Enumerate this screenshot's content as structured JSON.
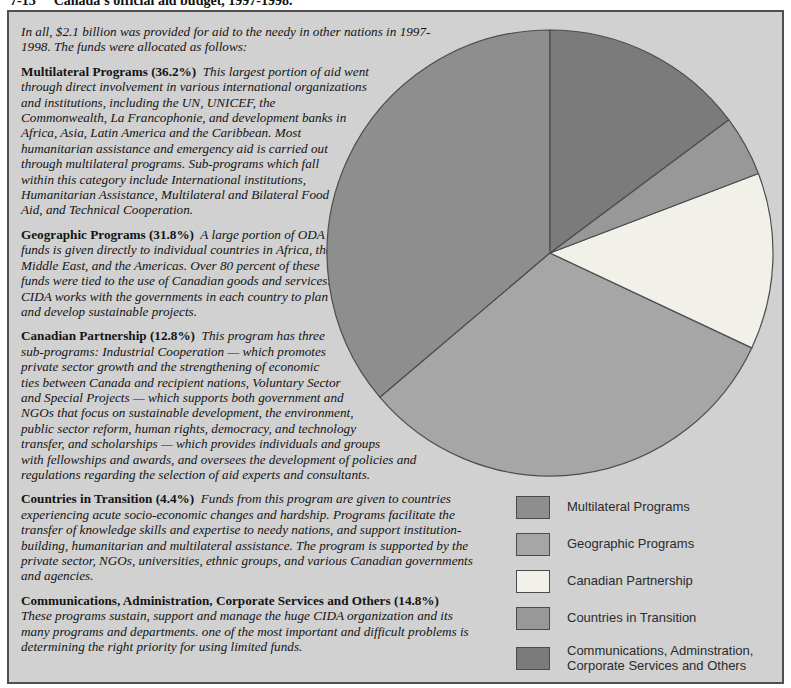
{
  "figure": {
    "label": "7-13",
    "title": "Canada's official aid budget, 1997-1998."
  },
  "article": {
    "intro": "In all, $2.1 billion was provided for aid to the needy in other nations in 1997-1998. The funds were allocated as follows:",
    "sections": [
      {
        "heading": "Multilateral Programs (36.2%)",
        "body": "This largest portion of aid went through direct involvement in various international organizations and institutions, including the UN, UNICEF, the Commonwealth, La Francophonie, and development banks in Africa, Asia, Latin America and the Caribbean. Most humanitarian assistance and emergency aid is carried out through multilateral programs. Sub-programs which fall within this category include International institutions, Humanitarian Assistance, Multilateral and Bilateral Food Aid, and Technical Cooperation."
      },
      {
        "heading": "Geographic Programs (31.8%)",
        "body": "A large portion of ODA funds is given directly to individual countries in Africa, the Middle East, and the Americas. Over 80 percent of these funds were tied to the use of Canadian goods and services. CIDA works with the governments in each country to plan and develop sustainable projects."
      },
      {
        "heading": "Canadian Partnership (12.8%)",
        "body": "This program has three sub-programs: Industrial Cooperation — which promotes private sector growth and the strengthening of economic ties between Canada and recipient nations, Voluntary Sector and Special Projects — which supports both government and NGOs that focus on sustainable development, the environment, public sector reform, human rights, democracy, and technology transfer, and scholarships — which provides individuals and groups with fellowships and awards, and oversees the development of policies and regulations regarding the selection of aid experts and consultants."
      },
      {
        "heading": "Countries in Transition (4.4%)",
        "body": "Funds from this program are given to countries experiencing acute socio-economic changes and hardship. Programs facilitate the transfer of knowledge skills and expertise to needy nations, and support institution-building, humanitarian and multilateral assistance. The program is supported by the private sector, NGOs, universities, ethnic groups, and various Canadian governments and agencies."
      },
      {
        "heading": "Communications, Administration, Corporate Services and Others (14.8%)",
        "body": "These programs sustain, support and manage the huge CIDA organization and its many programs and departments. one of the most important and difficult problems is determining the right priority for using limited funds."
      }
    ]
  },
  "legend": {
    "items": [
      {
        "label": "Multilateral Programs"
      },
      {
        "label": "Geographic Programs"
      },
      {
        "label": "Canadian Partnership"
      },
      {
        "label": "Countries in Transition"
      },
      {
        "label": "Communications, Adminstration,\nCorporate Services and Others"
      }
    ]
  },
  "chart_data": {
    "type": "pie",
    "title": "Canada's official aid budget, 1997-1998",
    "slices": [
      {
        "label": "Multilateral Programs",
        "value": 36.2,
        "color": "#8e8e8e"
      },
      {
        "label": "Geographic Programs",
        "value": 31.8,
        "color": "#a6a6a6"
      },
      {
        "label": "Canadian Partnership",
        "value": 12.8,
        "color": "#f1f1ea"
      },
      {
        "label": "Countries in Transition",
        "value": 4.4,
        "color": "#989898"
      },
      {
        "label": "Communications, Administration, Corporate Services and Others",
        "value": 14.8,
        "color": "#7b7b7b"
      }
    ],
    "start_position": "12 o'clock",
    "direction": "counterclockwise",
    "stroke_color": "#4d4d4d",
    "legend_position": "bottom-right",
    "background_color": "#d1d1d1"
  }
}
